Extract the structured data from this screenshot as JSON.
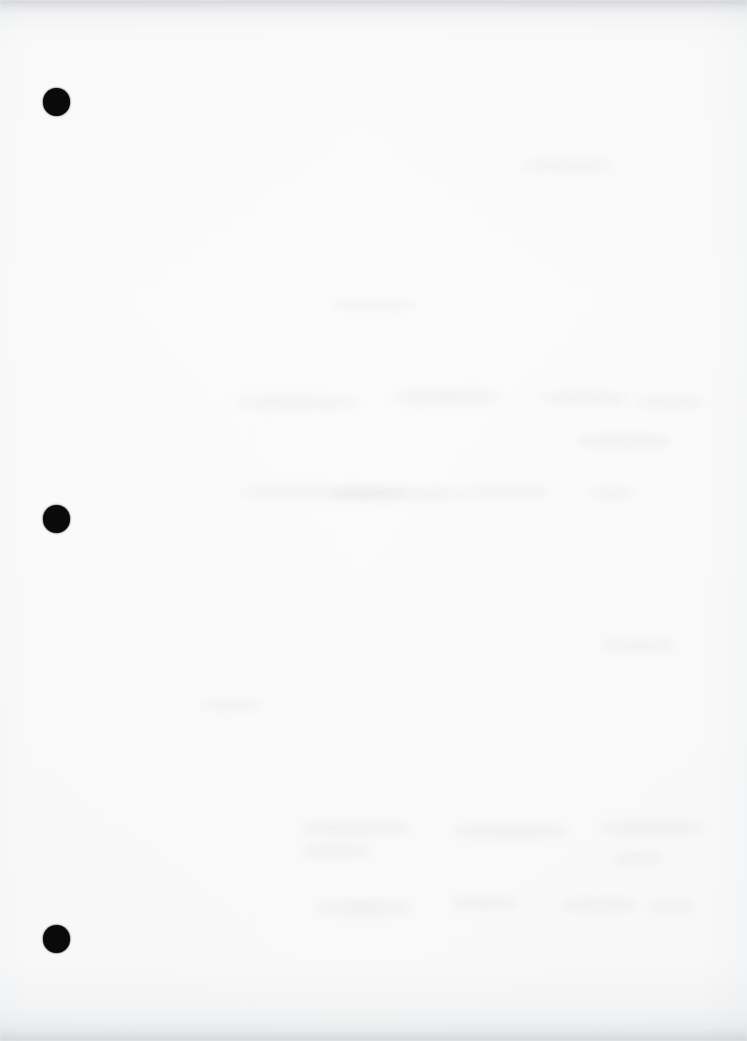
{
  "page": {
    "kind": "scanned-blank-document-page",
    "width": 747,
    "height": 1041,
    "background_color": "#fdfdfd",
    "paper_tone": "#fefefe",
    "visible_text": "",
    "text_note": "No legible text present on the page"
  },
  "marks": {
    "ink_color": "#0a0a0a",
    "punch_holes": [
      {
        "label": "top-punch-hole",
        "cx": 56.5,
        "cy": 102,
        "diameter": 27.5
      },
      {
        "label": "middle-punch-hole",
        "cx": 56.5,
        "cy": 519,
        "diameter": 27.5
      },
      {
        "label": "bottom-punch-hole",
        "cx": 56.5,
        "cy": 939,
        "diameter": 27.5
      }
    ]
  },
  "artifacts": {
    "edge_shadow_color": "#9a9ca0",
    "ghost_color": "#787c82",
    "top_band_height": 26,
    "bottom_band_height": 34,
    "ghost_smudges": [
      {
        "x": 236,
        "y": 396,
        "w": 124,
        "h": 13
      },
      {
        "x": 392,
        "y": 390,
        "w": 108,
        "h": 15
      },
      {
        "x": 540,
        "y": 392,
        "w": 88,
        "h": 13
      },
      {
        "x": 636,
        "y": 396,
        "w": 68,
        "h": 12
      },
      {
        "x": 576,
        "y": 434,
        "w": 96,
        "h": 14
      },
      {
        "x": 238,
        "y": 486,
        "w": 168,
        "h": 13
      },
      {
        "x": 330,
        "y": 488,
        "w": 142,
        "h": 12
      },
      {
        "x": 470,
        "y": 486,
        "w": 80,
        "h": 12
      },
      {
        "x": 590,
        "y": 488,
        "w": 44,
        "h": 11
      },
      {
        "x": 300,
        "y": 820,
        "w": 110,
        "h": 16
      },
      {
        "x": 300,
        "y": 844,
        "w": 72,
        "h": 14
      },
      {
        "x": 452,
        "y": 824,
        "w": 118,
        "h": 15
      },
      {
        "x": 600,
        "y": 820,
        "w": 104,
        "h": 16
      },
      {
        "x": 612,
        "y": 852,
        "w": 52,
        "h": 13
      },
      {
        "x": 316,
        "y": 900,
        "w": 96,
        "h": 16
      },
      {
        "x": 452,
        "y": 896,
        "w": 66,
        "h": 14
      },
      {
        "x": 560,
        "y": 898,
        "w": 78,
        "h": 14
      },
      {
        "x": 648,
        "y": 900,
        "w": 48,
        "h": 13
      },
      {
        "x": 330,
        "y": 300,
        "w": 86,
        "h": 10
      },
      {
        "x": 520,
        "y": 160,
        "w": 96,
        "h": 11
      },
      {
        "x": 600,
        "y": 640,
        "w": 76,
        "h": 11
      },
      {
        "x": 200,
        "y": 700,
        "w": 64,
        "h": 10
      }
    ]
  }
}
